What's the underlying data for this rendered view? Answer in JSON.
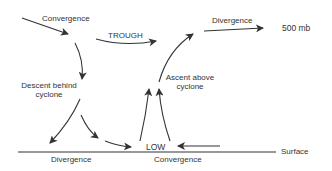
{
  "diagram": {
    "labels": {
      "convergence_top": "Convergence",
      "trough": "TROUGH",
      "divergence_top": "Divergence",
      "level_500mb": "500 mb",
      "descent": "Descent  behind",
      "descent_line2": "cyclone",
      "ascent": "Ascent  above",
      "ascent_line2": "cyclone",
      "low": "LOW",
      "divergence_bottom": "Divergence",
      "convergence_bottom": "Convergence",
      "surface": "Surface"
    },
    "colors": {
      "line": "#333333",
      "background": "#ffffff"
    }
  }
}
